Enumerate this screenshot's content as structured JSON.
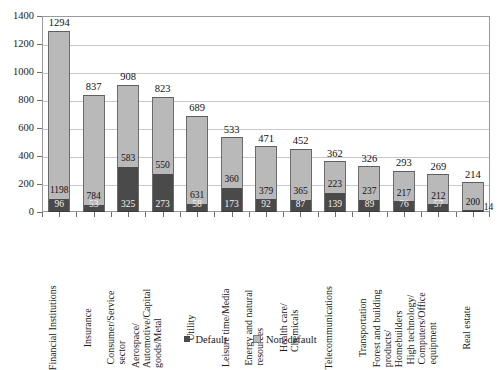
{
  "chart_data": {
    "type": "bar",
    "stacked": true,
    "title": "",
    "xlabel": "",
    "ylabel": "",
    "ylim": [
      0,
      1400
    ],
    "ytick_values": [
      0,
      200,
      400,
      600,
      800,
      1000,
      1200,
      1400
    ],
    "ytick_labels": [
      "0",
      "200",
      "400",
      "600",
      "800",
      "1000",
      "1200",
      "1400"
    ],
    "grid": "horizontal",
    "legend_position": "bottom",
    "legend": [
      {
        "label": "Default",
        "color": "#4a4a4a"
      },
      {
        "label": "Non-default",
        "color": "#b9b9b9"
      }
    ],
    "categories": [
      "Financial Institutions",
      "Insurance",
      "Consumer/Service sector",
      "Aerospace/ Automotive/Capital goods/Metal",
      "Utility",
      "Leisure time/Media",
      "Energy and natural resources",
      "Health care/ Chemicals",
      "Telecommunications",
      "Transportation",
      "Forest and building products/ Homebuilders",
      "High technology/ Computers/Office equipment",
      "Real estate"
    ],
    "category_label_lines": [
      [
        "Financial Institutions"
      ],
      [
        "Insurance"
      ],
      [
        "Consumer/Service",
        "sector"
      ],
      [
        "Aerospace/",
        "Automotive/Capital",
        "goods/Metal"
      ],
      [
        "Utility"
      ],
      [
        "Leisure time/Media"
      ],
      [
        "Energy and natural",
        "resources"
      ],
      [
        "Health care/",
        "Chemicals"
      ],
      [
        "Telecommunications"
      ],
      [
        "Transportation"
      ],
      [
        "Forest and building",
        "products/",
        "Homebuilders"
      ],
      [
        "High technology/",
        "Computers/Office",
        "equipment"
      ],
      [
        "Real estate"
      ]
    ],
    "series": [
      {
        "name": "Default",
        "color": "#4a4a4a",
        "values": [
          96,
          53,
          325,
          273,
          58,
          173,
          92,
          87,
          139,
          89,
          76,
          57,
          14
        ]
      },
      {
        "name": "Non-default",
        "color": "#b9b9b9",
        "values": [
          1198,
          784,
          583,
          550,
          631,
          360,
          379,
          365,
          223,
          237,
          217,
          212,
          200
        ]
      }
    ],
    "totals": [
      1294,
      837,
      908,
      823,
      689,
      533,
      471,
      452,
      362,
      326,
      293,
      269,
      214
    ],
    "default_label_outside": [
      false,
      false,
      false,
      false,
      false,
      false,
      false,
      false,
      false,
      false,
      false,
      false,
      true
    ]
  }
}
